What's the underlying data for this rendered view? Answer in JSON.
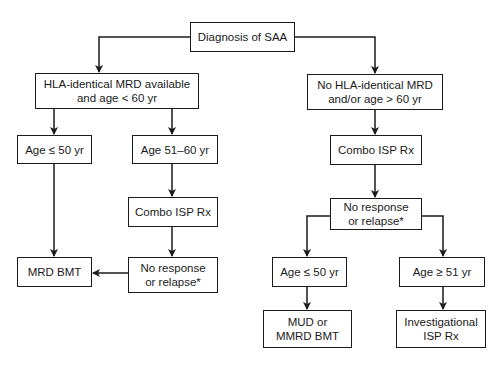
{
  "diagram": {
    "type": "flowchart",
    "nodes": {
      "root": {
        "label": "Diagnosis of SAA"
      },
      "hla_available": {
        "label": "HLA-identical MRD available\nand age < 60 yr"
      },
      "no_hla": {
        "label": "No HLA-identical MRD\nand/or age > 60 yr"
      },
      "age_le_50_left": {
        "label": "Age ≤ 50 yr"
      },
      "age_51_60": {
        "label": "Age 51–60 yr"
      },
      "combo_isp_left": {
        "label": "Combo ISP Rx"
      },
      "mrd_bmt": {
        "label": "MRD BMT"
      },
      "no_response_left": {
        "label": "No response\nor relapse*"
      },
      "combo_isp_right": {
        "label": "Combo ISP Rx"
      },
      "no_response_right": {
        "label": "No response\nor relapse*"
      },
      "age_le_50_right": {
        "label": "Age ≤ 50 yr"
      },
      "age_ge_51": {
        "label": "Age ≥ 51 yr"
      },
      "mud_mmrd_bmt": {
        "label": "MUD or\nMMRD BMT"
      },
      "investigational_isp": {
        "label": "Investigational\nISP Rx"
      }
    },
    "edges": [
      [
        "root",
        "hla_available"
      ],
      [
        "root",
        "no_hla"
      ],
      [
        "hla_available",
        "age_le_50_left"
      ],
      [
        "hla_available",
        "age_51_60"
      ],
      [
        "age_le_50_left",
        "mrd_bmt"
      ],
      [
        "age_51_60",
        "combo_isp_left"
      ],
      [
        "combo_isp_left",
        "no_response_left"
      ],
      [
        "no_response_left",
        "mrd_bmt"
      ],
      [
        "no_hla",
        "combo_isp_right"
      ],
      [
        "combo_isp_right",
        "no_response_right"
      ],
      [
        "no_response_right",
        "age_le_50_right"
      ],
      [
        "no_response_right",
        "age_ge_51"
      ],
      [
        "age_le_50_right",
        "mud_mmrd_bmt"
      ],
      [
        "age_ge_51",
        "investigational_isp"
      ]
    ],
    "colors": {
      "line": "#1a1a1a",
      "background": "#ffffff"
    }
  }
}
